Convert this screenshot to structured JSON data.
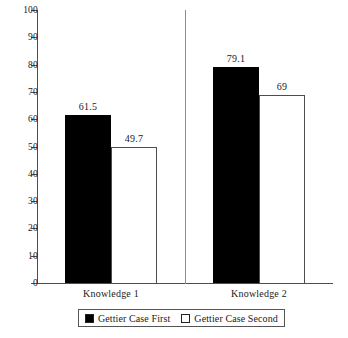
{
  "chart_data": {
    "type": "bar",
    "title": "",
    "subtitle": "",
    "xlabel": "",
    "ylabel": "",
    "categories": [
      "Knowledge 1",
      "Knowledge 2"
    ],
    "series": [
      {
        "name": "Gettier Case First",
        "values": [
          61.5,
          79.1
        ],
        "value_labels": [
          "61.5",
          "79.1"
        ],
        "color": "#000000",
        "style": "filled"
      },
      {
        "name": "Gettier Case Second",
        "values": [
          49.7,
          69
        ],
        "value_labels": [
          "49.7",
          "69"
        ],
        "color": "#ffffff",
        "style": "hollow"
      }
    ],
    "ylim": [
      0,
      100
    ],
    "ytick_step": 10,
    "ytick_labels": [
      "100",
      "90",
      "80",
      "70",
      "60",
      "50",
      "40",
      "30",
      "20",
      "10",
      "0"
    ],
    "grid": false,
    "legend_position": "bottom"
  },
  "axis": {
    "line_color": "#4d4d4d"
  },
  "legend": {
    "entries": [
      {
        "label": "Gettier Case First",
        "style": "filled"
      },
      {
        "label": "Gettier Case Second",
        "style": "hollow"
      }
    ]
  }
}
